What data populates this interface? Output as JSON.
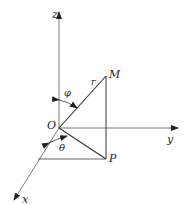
{
  "diagram": {
    "type": "spherical-coordinates",
    "labels": {
      "z_axis": "z",
      "y_axis": "y",
      "x_axis": "x",
      "origin": "O",
      "point_m": "M",
      "point_p": "P",
      "radius": "r",
      "phi": "φ",
      "theta": "θ"
    },
    "colors": {
      "line": "#333333",
      "background": "#ffffff"
    }
  }
}
